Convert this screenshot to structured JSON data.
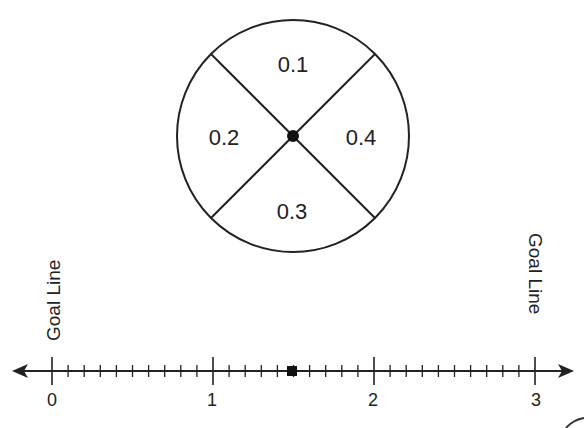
{
  "spinner": {
    "sections": [
      {
        "label": "0.1",
        "position": "top"
      },
      {
        "label": "0.2",
        "position": "left"
      },
      {
        "label": "0.3",
        "position": "bottom"
      },
      {
        "label": "0.4",
        "position": "right"
      }
    ]
  },
  "number_line": {
    "min": 0,
    "max": 3,
    "subdivisions_per_unit": 10,
    "tick_labels": [
      "0",
      "1",
      "2",
      "3"
    ],
    "marker_value": 1.5,
    "left_goal_label": "Goal Line",
    "right_goal_label": "Goal Line"
  },
  "colors": {
    "stroke": "#222222",
    "background": "#ffffff"
  }
}
